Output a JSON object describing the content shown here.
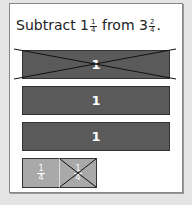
{
  "problem": {
    "prefix": "Subtract ",
    "whole1": "1",
    "num1": "1",
    "den1": "4",
    "middle": " from ",
    "whole2": "3",
    "num2": "2",
    "den2": "4",
    "suffix": "."
  },
  "model": {
    "whole_bars": [
      {
        "label": "1",
        "crossed_out": true
      },
      {
        "label": "1",
        "crossed_out": false
      },
      {
        "label": "1",
        "crossed_out": false
      }
    ],
    "fraction_parts": [
      {
        "num": "1",
        "den": "4",
        "crossed_out": false
      },
      {
        "num": "1",
        "den": "4",
        "crossed_out": true
      }
    ]
  },
  "colors": {
    "whole_bar": "#5a5a5a",
    "fraction_bar": "#a9a9a9"
  }
}
